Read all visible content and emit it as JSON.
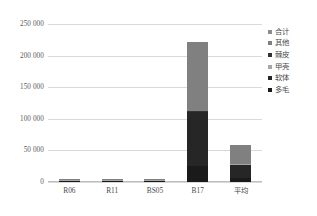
{
  "chart_data": {
    "type": "bar",
    "stacked": true,
    "title": "",
    "xlabel": "",
    "ylabel": "",
    "ylim": [
      0,
      250000
    ],
    "ytick_labels": [
      "250 000",
      "200 000",
      "150 000",
      "100 000",
      "50 000",
      "0"
    ],
    "ytick_values": [
      250000,
      200000,
      150000,
      100000,
      50000,
      0
    ],
    "grid": true,
    "legend_position": "right",
    "categories": [
      "R06",
      "R11",
      "BS05",
      "B17",
      "平均"
    ],
    "series": [
      {
        "name": "多毛",
        "color": "#1a1a1a",
        "values": [
          400,
          300,
          500,
          25000,
          6500
        ]
      },
      {
        "name": "软体",
        "color": "#262626",
        "values": [
          300,
          250,
          400,
          85000,
          20500
        ]
      },
      {
        "name": "甲壳",
        "color": "#a6a6a6",
        "values": [
          200,
          150,
          300,
          500,
          300
        ]
      },
      {
        "name": "棘皮",
        "color": "#333333",
        "values": [
          100,
          100,
          200,
          400,
          200
        ]
      },
      {
        "name": "其他",
        "color": "#808080",
        "values": [
          200,
          200,
          400,
          109000,
          29500
        ]
      },
      {
        "name": "合计",
        "color": "#8c8c8c",
        "values": [
          0,
          0,
          0,
          0,
          0
        ]
      }
    ],
    "totals": [
      1200,
      1000,
      1800,
      219900,
      57000
    ]
  },
  "legend": {
    "items": [
      {
        "label": "合计",
        "color": "#8c8c8c"
      },
      {
        "label": "其他",
        "color": "#808080"
      },
      {
        "label": "棘皮",
        "color": "#333333"
      },
      {
        "label": "甲壳",
        "color": "#a6a6a6"
      },
      {
        "label": "软体",
        "color": "#262626"
      },
      {
        "label": "多毛",
        "color": "#1a1a1a"
      }
    ]
  },
  "colors": {
    "gridline": "#d9d9d9",
    "axis": "#bfbfbf",
    "text": "#4a4a4a",
    "background": "#ffffff"
  }
}
